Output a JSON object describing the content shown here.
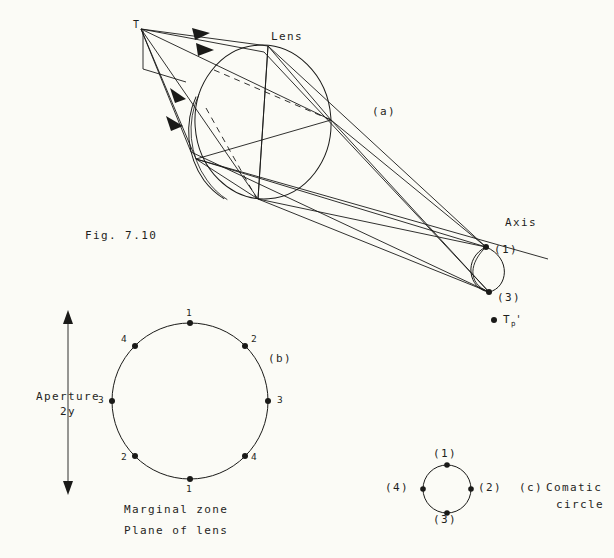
{
  "figure": {
    "number_label": "Fig. 7.10",
    "background_color": "#fbfbf6",
    "ink_color": "#1a1a18"
  },
  "panel_a": {
    "key": "(a)",
    "source_point_label": "T",
    "lens_label": "Lens",
    "axis_label": "Axis",
    "image_point_labels": {
      "upper": "(1)",
      "lower": "(3)"
    },
    "focus_label_base": "T",
    "focus_label_sub": "p",
    "focus_label_prime": "'"
  },
  "panel_b": {
    "key": "(b)",
    "caption_line_1": "Marginal zone",
    "caption_line_2": "Plane of lens",
    "aperture_label_line_1": "Aperture",
    "aperture_label_line_2": "2y",
    "zone_points": [
      {
        "label": "1",
        "angle_deg": 90
      },
      {
        "label": "2",
        "angle_deg": 45
      },
      {
        "label": "3",
        "angle_deg": 0
      },
      {
        "label": "4",
        "angle_deg": -45
      },
      {
        "label": "1",
        "angle_deg": -90
      },
      {
        "label": "2",
        "angle_deg": -135
      },
      {
        "label": "3",
        "angle_deg": 180
      },
      {
        "label": "4",
        "angle_deg": 135
      }
    ]
  },
  "panel_c": {
    "key": "(c)",
    "caption_line_1": "Comatic",
    "caption_line_2": "circle",
    "circle_points": [
      {
        "label": "(1)",
        "angle_deg": 90
      },
      {
        "label": "(2)",
        "angle_deg": 0
      },
      {
        "label": "(3)",
        "angle_deg": -90
      },
      {
        "label": "(4)",
        "angle_deg": 180
      }
    ]
  }
}
